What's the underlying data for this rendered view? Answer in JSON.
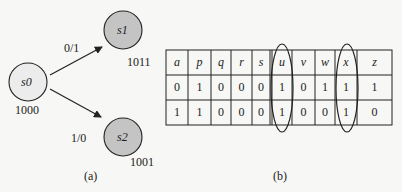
{
  "panel_a": {
    "caption": "(a)",
    "nodes": [
      {
        "id": "s0",
        "label": "s0",
        "code": "1000",
        "fill": "#ececec"
      },
      {
        "id": "s1",
        "label": "s1",
        "code": "1011",
        "fill": "#c4c4c4"
      },
      {
        "id": "s2",
        "label": "s2",
        "code": "1001",
        "fill": "#c4c4c4"
      }
    ],
    "edges": [
      {
        "from": "s0",
        "to": "s1",
        "label": "0/1"
      },
      {
        "from": "s0",
        "to": "s2",
        "label": "1/0"
      }
    ]
  },
  "panel_b": {
    "caption": "(b)",
    "headers": [
      "a",
      "p",
      "q",
      "r",
      "s",
      "u",
      "v",
      "w",
      "x",
      "z"
    ],
    "rows": [
      [
        "0",
        "1",
        "0",
        "0",
        "0",
        "1",
        "0",
        "1",
        "1",
        "1"
      ],
      [
        "1",
        "1",
        "0",
        "0",
        "0",
        "1",
        "0",
        "0",
        "1",
        "0"
      ]
    ],
    "highlighted_columns": [
      "u",
      "x"
    ]
  }
}
